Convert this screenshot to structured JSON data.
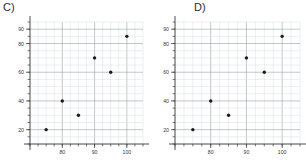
{
  "chart_data": [
    {
      "type": "scatter",
      "title": "C)",
      "xlabel": "",
      "ylabel": "",
      "xlim": [
        70,
        105
      ],
      "ylim": [
        10,
        95
      ],
      "grid": true,
      "legend": "none",
      "x_ticks": [
        80,
        90,
        100
      ],
      "x_tick_labels": [
        "80",
        "90",
        "100"
      ],
      "y_ticks": [
        20,
        40,
        60,
        80,
        90
      ],
      "y_tick_labels": [
        "20",
        "40",
        "60",
        "80",
        "90"
      ],
      "x_minor_step": 2.5,
      "y_minor_step": 5,
      "points": [
        {
          "x": 75,
          "y": 20
        },
        {
          "x": 80,
          "y": 40
        },
        {
          "x": 85,
          "y": 30
        },
        {
          "x": 90,
          "y": 70
        },
        {
          "x": 95,
          "y": 60
        },
        {
          "x": 100,
          "y": 85
        }
      ],
      "marker_color": "#1c1c1c"
    },
    {
      "type": "scatter",
      "title": "D)",
      "xlabel": "",
      "ylabel": "",
      "xlim": [
        70,
        105
      ],
      "ylim": [
        10,
        95
      ],
      "grid": true,
      "legend": "none",
      "x_ticks": [
        80,
        90,
        100
      ],
      "x_tick_labels": [
        "80",
        "90",
        "100"
      ],
      "y_ticks": [
        20,
        40,
        60,
        80,
        90
      ],
      "y_tick_labels": [
        "20",
        "40",
        "60",
        "80",
        "90"
      ],
      "x_minor_step": 2.5,
      "y_minor_step": 5,
      "points": [
        {
          "x": 75,
          "y": 20
        },
        {
          "x": 80,
          "y": 40
        },
        {
          "x": 85,
          "y": 30
        },
        {
          "x": 90,
          "y": 70
        },
        {
          "x": 95,
          "y": 60
        },
        {
          "x": 100,
          "y": 85
        }
      ],
      "marker_color": "#1c1c1c"
    }
  ],
  "panels": {
    "c": {
      "label": "C)"
    },
    "d": {
      "label": "D)"
    }
  },
  "colors": {
    "background": "#ffffff",
    "grid_minor": "#d9dce3",
    "grid_major": "#9aa0ab",
    "axis": "#3a3a3a",
    "marker": "#1c1c1c",
    "text": "#2b2b2b"
  }
}
